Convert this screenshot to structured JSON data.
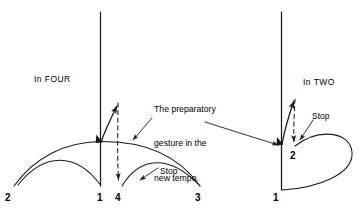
{
  "figure": {
    "ink_color": "#1a1a1a",
    "background_color": "#ffffff",
    "panels": [
      {
        "id": "left",
        "label": "In FOUR",
        "beat_numbers": [
          "2",
          "1",
          "4",
          "3"
        ],
        "stop_label": "Stop"
      },
      {
        "id": "right",
        "label": "In TWO",
        "beat_numbers": [
          "2",
          "1"
        ],
        "stop_label": "Stop"
      }
    ],
    "annotation": {
      "line1": "The preparatory",
      "line2": "gesture in the",
      "line3": "new tempo."
    },
    "labels": {
      "in_four": "In FOUR",
      "in_two": "In TWO",
      "stop_left": "Stop",
      "stop_right": "Stop",
      "num_2_left": "2",
      "num_1_left": "1",
      "num_4_left": "4",
      "num_3_left": "3",
      "num_2_right": "2",
      "num_1_right": "1"
    }
  }
}
